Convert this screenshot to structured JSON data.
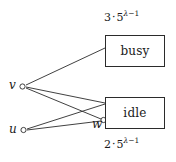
{
  "figure": {
    "background": "#ffffff",
    "stroke_color": "#2b2b2b",
    "text_color": "#1a1a1a"
  },
  "boxes": [
    {
      "id": "busy",
      "label": "busy",
      "x": 105,
      "y": 35,
      "width": 60,
      "height": 32
    },
    {
      "id": "idle",
      "label": "idle",
      "x": 105,
      "y": 97,
      "width": 60,
      "height": 32
    }
  ],
  "rate_labels": {
    "top": {
      "text": "3 · 5^(λ−1)",
      "coefficient": "3",
      "dot": "·",
      "base": "5",
      "exponent_lambda": "λ",
      "exponent_minus": "−",
      "exponent_one": "1"
    },
    "bottom": {
      "text": "2 · 5^(λ−1)",
      "coefficient": "2",
      "dot": "·",
      "base": "5",
      "exponent_lambda": "λ",
      "exponent_minus": "−",
      "exponent_one": "1"
    }
  },
  "nodes": [
    {
      "id": "v",
      "label": "v",
      "cx": 22,
      "cy": 86
    },
    {
      "id": "u",
      "label": "u",
      "cx": 23,
      "cy": 130
    },
    {
      "id": "w",
      "label": "w",
      "cx": 104,
      "cy": 120
    }
  ],
  "edges": [
    {
      "from": "v",
      "to": "busy-left-upper",
      "x1": 25,
      "y1": 85,
      "x2": 105,
      "y2": 48
    },
    {
      "from": "v",
      "to": "idle-left-top",
      "x1": 25,
      "y1": 87,
      "x2": 105,
      "y2": 104
    },
    {
      "from": "v",
      "to": "w",
      "x1": 25,
      "y1": 88,
      "x2": 101,
      "y2": 119
    },
    {
      "from": "u",
      "to": "w",
      "x1": 26,
      "y1": 130,
      "x2": 101,
      "y2": 121
    },
    {
      "from": "u",
      "to": "idle-left-top",
      "x1": 26,
      "y1": 129,
      "x2": 105,
      "y2": 104
    }
  ]
}
